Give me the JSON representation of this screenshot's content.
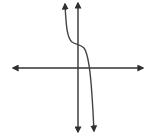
{
  "figure": {
    "background": "#ffffff",
    "stroke_color": "#3a3a3a",
    "curve_color": "#4a4a4a"
  },
  "axes": {
    "x_axis": {
      "y": 68,
      "x_start": 12,
      "x_end": 144,
      "arrows": "both"
    },
    "y_axis": {
      "x": 78,
      "y_start": 2,
      "y_end": 133,
      "arrows": "both"
    }
  },
  "curve": {
    "type": "cubic",
    "leading_coefficient_sign": "negative",
    "inflection_point": [
      78,
      45
    ],
    "x_intercept_px": 88,
    "start_arrow": [
      65,
      3
    ],
    "end_arrow": [
      94,
      132
    ]
  }
}
